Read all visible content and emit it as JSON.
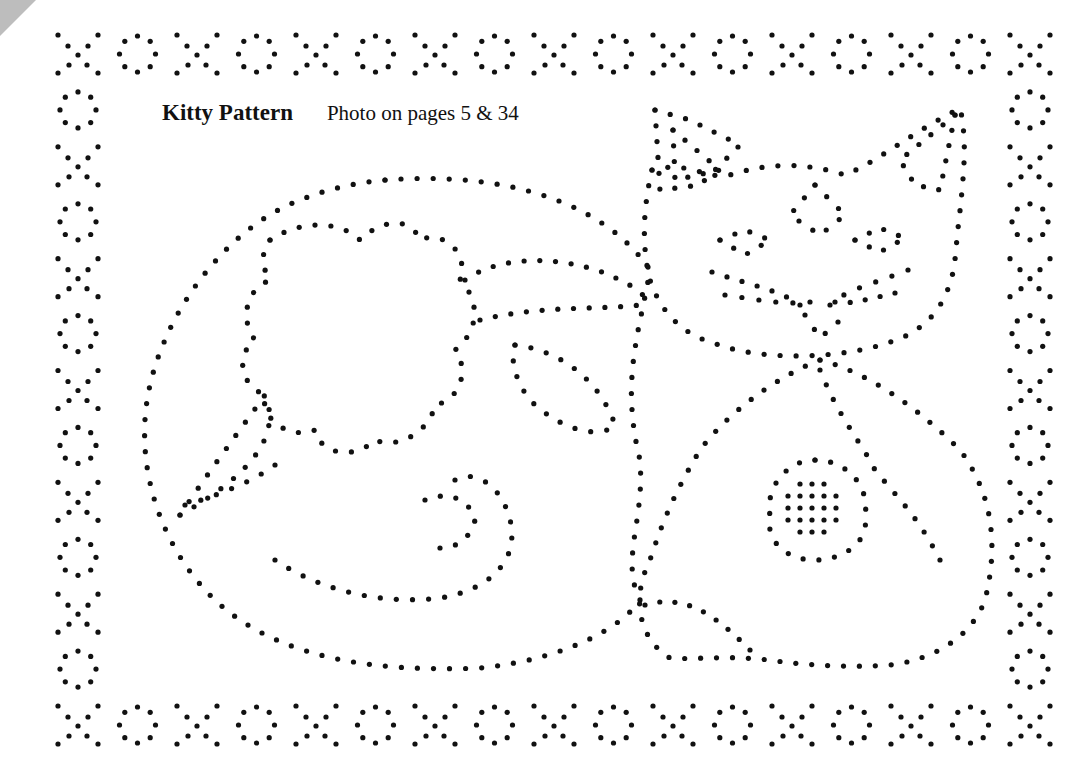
{
  "title": "Kitty Pattern",
  "subtitle": "Photo on pages 5 & 34",
  "colors": {
    "background": "#ffffff",
    "dot": "#111111",
    "ink": "#111111",
    "corner_fold": "#bdbdbd"
  },
  "border": {
    "top_row": "X O X O X O X O X O X O X O X O X",
    "bottom_row": "X O X O X O X O X O X O X O X O X",
    "left_column": "X O X O X O X O X O X O X",
    "right_column": "X O X O X O X O X O X O X",
    "motifs": [
      "x-motif",
      "o-motif"
    ]
  },
  "pattern": {
    "subject": "cat curled beside a flower with leaves",
    "elements": [
      "cat-head",
      "cat-ear-left",
      "cat-ear-right",
      "cat-eyes",
      "cat-nose",
      "cat-whiskers",
      "cat-body",
      "cat-paw",
      "cat-tail",
      "flower",
      "flower-leaves",
      "body-flower"
    ]
  }
}
